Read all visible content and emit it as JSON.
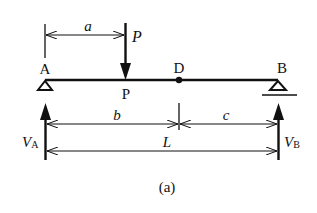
{
  "diagram": {
    "type": "simply-supported-beam",
    "caption": "(a)",
    "points": {
      "A": "A",
      "B": "B",
      "D": "D",
      "P_point": "P"
    },
    "load": {
      "label": "P"
    },
    "reactions": {
      "VA": {
        "main": "V",
        "sub": "A"
      },
      "VB": {
        "main": "V",
        "sub": "B"
      }
    },
    "dimensions": {
      "a": "a",
      "b": "b",
      "c": "c",
      "L": "L"
    },
    "colors": {
      "ink": "#111111",
      "background": "#ffffff"
    }
  }
}
